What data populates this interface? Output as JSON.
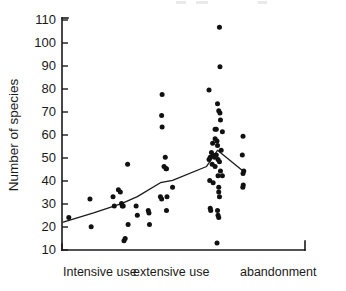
{
  "chart_data": {
    "type": "scatter",
    "title": "",
    "xlabel": "",
    "ylabel": "Number of species",
    "ylim": [
      10,
      110
    ],
    "xlim": [
      0,
      10
    ],
    "grid": false,
    "legend": null,
    "yticks": [
      10,
      20,
      30,
      40,
      50,
      60,
      70,
      80,
      90,
      100,
      110
    ],
    "ytick_labels": [
      "10",
      "20",
      "30",
      "40",
      "50",
      "60",
      "70",
      "80",
      "90",
      "100",
      "110"
    ],
    "xtick_labels": [
      "Intensive use",
      "extensive use",
      "abandonment"
    ],
    "categories": [
      "Intensive use",
      "extensive use",
      "abandonment"
    ],
    "series": [
      {
        "name": "sites",
        "marker": "filled-circle",
        "color": "#111111",
        "points": [
          {
            "x": 0.28,
            "y": 24
          },
          {
            "x": 1.15,
            "y": 32
          },
          {
            "x": 1.2,
            "y": 20
          },
          {
            "x": 2.1,
            "y": 33
          },
          {
            "x": 2.15,
            "y": 29
          },
          {
            "x": 2.32,
            "y": 36
          },
          {
            "x": 2.4,
            "y": 35
          },
          {
            "x": 2.45,
            "y": 30
          },
          {
            "x": 2.48,
            "y": 29
          },
          {
            "x": 2.52,
            "y": 29
          },
          {
            "x": 2.7,
            "y": 47
          },
          {
            "x": 2.72,
            "y": 21
          },
          {
            "x": 2.55,
            "y": 14
          },
          {
            "x": 2.6,
            "y": 15
          },
          {
            "x": 3.05,
            "y": 29
          },
          {
            "x": 3.1,
            "y": 25
          },
          {
            "x": 3.55,
            "y": 27
          },
          {
            "x": 3.58,
            "y": 26
          },
          {
            "x": 3.6,
            "y": 21
          },
          {
            "x": 4.12,
            "y": 77
          },
          {
            "x": 4.1,
            "y": 68
          },
          {
            "x": 4.12,
            "y": 63
          },
          {
            "x": 4.25,
            "y": 50
          },
          {
            "x": 4.2,
            "y": 46
          },
          {
            "x": 4.28,
            "y": 45
          },
          {
            "x": 4.3,
            "y": 45
          },
          {
            "x": 4.05,
            "y": 33
          },
          {
            "x": 4.1,
            "y": 32
          },
          {
            "x": 4.32,
            "y": 33
          },
          {
            "x": 4.3,
            "y": 27
          },
          {
            "x": 4.55,
            "y": 37
          },
          {
            "x": 6.05,
            "y": 79
          },
          {
            "x": 6.48,
            "y": 106
          },
          {
            "x": 6.5,
            "y": 89
          },
          {
            "x": 6.4,
            "y": 73
          },
          {
            "x": 6.45,
            "y": 70
          },
          {
            "x": 6.5,
            "y": 69
          },
          {
            "x": 6.52,
            "y": 66
          },
          {
            "x": 6.3,
            "y": 62
          },
          {
            "x": 6.35,
            "y": 62
          },
          {
            "x": 6.6,
            "y": 61
          },
          {
            "x": 6.3,
            "y": 58
          },
          {
            "x": 6.38,
            "y": 57
          },
          {
            "x": 6.2,
            "y": 56
          },
          {
            "x": 6.4,
            "y": 55
          },
          {
            "x": 6.55,
            "y": 53
          },
          {
            "x": 6.15,
            "y": 52
          },
          {
            "x": 6.22,
            "y": 51
          },
          {
            "x": 6.35,
            "y": 51
          },
          {
            "x": 6.1,
            "y": 50
          },
          {
            "x": 6.28,
            "y": 50
          },
          {
            "x": 6.42,
            "y": 49
          },
          {
            "x": 6.48,
            "y": 48
          },
          {
            "x": 6.05,
            "y": 49
          },
          {
            "x": 6.18,
            "y": 47
          },
          {
            "x": 6.3,
            "y": 46
          },
          {
            "x": 6.52,
            "y": 44
          },
          {
            "x": 6.6,
            "y": 42
          },
          {
            "x": 6.42,
            "y": 42
          },
          {
            "x": 6.08,
            "y": 40
          },
          {
            "x": 6.22,
            "y": 39
          },
          {
            "x": 6.45,
            "y": 37
          },
          {
            "x": 6.45,
            "y": 35
          },
          {
            "x": 6.48,
            "y": 33
          },
          {
            "x": 6.1,
            "y": 28
          },
          {
            "x": 6.12,
            "y": 27
          },
          {
            "x": 6.4,
            "y": 27
          },
          {
            "x": 6.42,
            "y": 25
          },
          {
            "x": 6.45,
            "y": 24
          },
          {
            "x": 6.38,
            "y": 13
          },
          {
            "x": 7.45,
            "y": 59
          },
          {
            "x": 7.42,
            "y": 51
          },
          {
            "x": 7.48,
            "y": 44
          },
          {
            "x": 7.45,
            "y": 43
          },
          {
            "x": 7.46,
            "y": 38
          },
          {
            "x": 7.44,
            "y": 37
          }
        ]
      }
    ],
    "trend_line": {
      "name": "mean trend",
      "color": "#1a1a1a",
      "points": [
        {
          "x": 0.05,
          "y": 22
        },
        {
          "x": 1.3,
          "y": 26
        },
        {
          "x": 2.45,
          "y": 30
        },
        {
          "x": 3.1,
          "y": 33
        },
        {
          "x": 4.05,
          "y": 39
        },
        {
          "x": 4.55,
          "y": 40
        },
        {
          "x": 5.95,
          "y": 46
        },
        {
          "x": 6.4,
          "y": 53
        },
        {
          "x": 7.45,
          "y": 44
        }
      ]
    }
  },
  "axis": {
    "y_label": "Number of species",
    "x_categories": [
      {
        "label": "Intensive use"
      },
      {
        "label": "extensive use"
      },
      {
        "label": "abandonment"
      }
    ]
  }
}
